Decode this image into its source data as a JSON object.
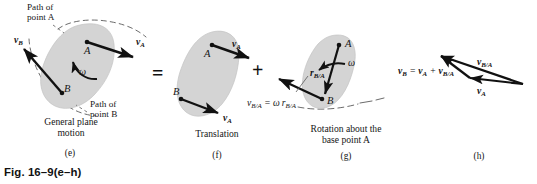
{
  "figure": {
    "title": "Fig. 16–9(e–h)",
    "domain_note": "Engineering mechanics diagram: general plane motion = translation + rotation"
  },
  "colors": {
    "body_fill": "#d4d4d4",
    "body_stroke": "#b8b8b8",
    "ink": "#111111",
    "path_dash": "#4a4a4a",
    "background": "#ffffff"
  },
  "operators": {
    "equals": "=",
    "plus": "+"
  },
  "panels": [
    {
      "id": "e",
      "tag": "(e)",
      "caption_line1": "General plane",
      "caption_line2": "motion",
      "annotations": [
        {
          "name": "path-of-point-a",
          "line1": "Path of",
          "line2": "point A"
        },
        {
          "name": "path-of-point-b",
          "line1": "Path of",
          "line2": "point B"
        }
      ],
      "points": [
        {
          "name": "point-a",
          "label": "A"
        },
        {
          "name": "point-b",
          "label": "B"
        }
      ],
      "vectors": [
        {
          "name": "velocity-a",
          "label_main": "v",
          "label_sub": "A"
        },
        {
          "name": "velocity-b",
          "label_main": "v",
          "label_sub": "B"
        }
      ],
      "omega": {
        "name": "omega-symbol",
        "label": "ω"
      }
    },
    {
      "id": "f",
      "tag": "(f)",
      "caption_line1": "Translation",
      "caption_line2": "",
      "annotations": [],
      "points": [
        {
          "name": "point-a",
          "label": "A"
        },
        {
          "name": "point-b",
          "label": "B"
        }
      ],
      "vectors": [
        {
          "name": "velocity-a-top",
          "label_main": "v",
          "label_sub": "A"
        },
        {
          "name": "velocity-a-bottom",
          "label_main": "v",
          "label_sub": "A"
        }
      ]
    },
    {
      "id": "g",
      "tag": "(g)",
      "caption_line1": "Rotation about the",
      "caption_line2": "base point A",
      "annotations": [],
      "points": [
        {
          "name": "point-a",
          "label": "A"
        },
        {
          "name": "point-b",
          "label": "B"
        }
      ],
      "vectors": [
        {
          "name": "position-vector-b-rel-a",
          "label_main": "r",
          "label_sub": "B/A"
        },
        {
          "name": "relative-velocity-b-rel-a",
          "label_main": "v",
          "label_sub": "B/A"
        }
      ],
      "omega": {
        "name": "omega-symbol",
        "label": "ω"
      },
      "equation": {
        "name": "relative-velocity-magnitude-equation",
        "lhs_main": "v",
        "lhs_sub": "B/A",
        "op": "=",
        "rhs_omega": "ω",
        "rhs_main": "r",
        "rhs_sub": "B/A"
      }
    },
    {
      "id": "h",
      "tag": "(h)",
      "caption_line1": "",
      "caption_line2": "",
      "annotations": [],
      "points": [],
      "vectors": [
        {
          "name": "resultant-velocity-b",
          "label_main": "v",
          "label_sub": "B/A"
        },
        {
          "name": "velocity-a",
          "label_main": "v",
          "label_sub": "A"
        },
        {
          "name": "relative-velocity-b-rel-a",
          "label_main": "v",
          "label_sub": "B/A"
        }
      ],
      "equation": {
        "name": "vector-addition-equation",
        "v_b_main": "v",
        "v_b_sub": "B",
        "eq": "=",
        "v_a_main": "v",
        "v_a_sub": "A",
        "plus": "+",
        "v_ba_main": "v",
        "v_ba_sub": "B/A"
      }
    }
  ]
}
